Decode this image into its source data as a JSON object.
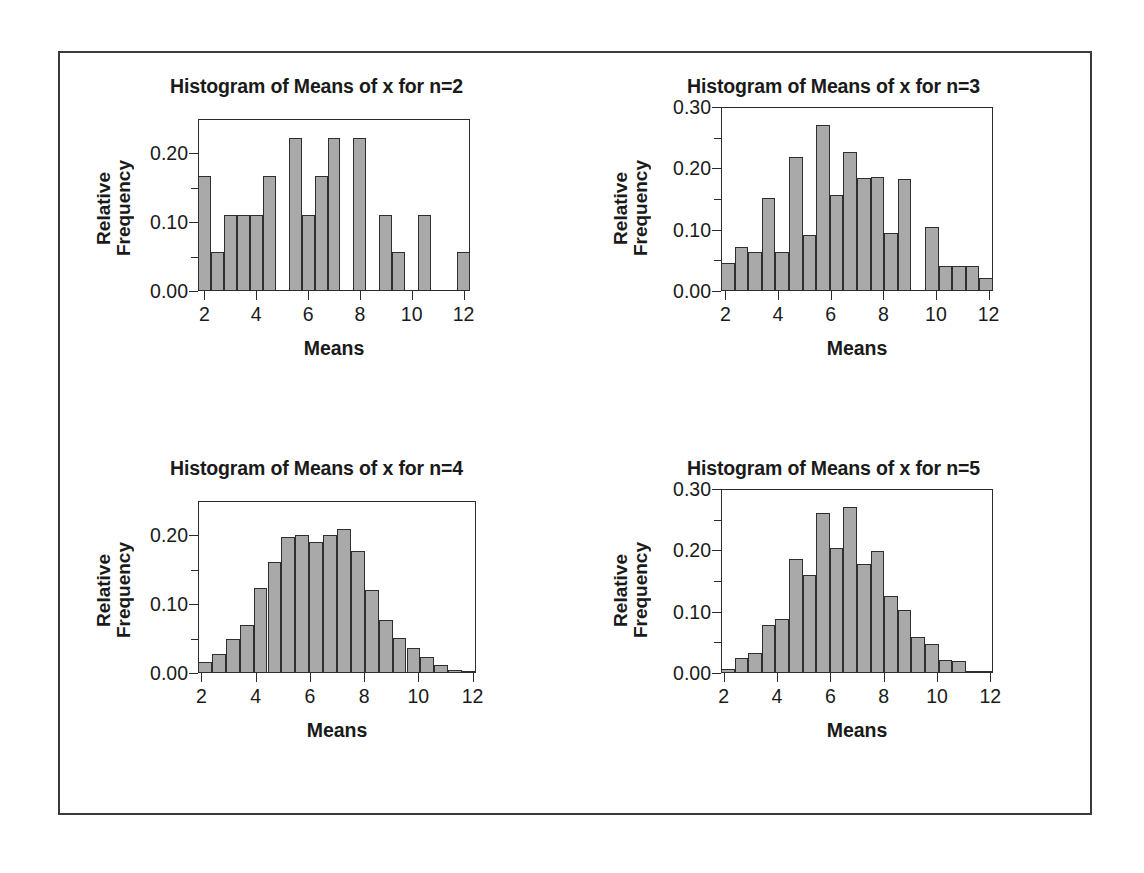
{
  "figure": {
    "border_color": "#3a3a3a",
    "background": "#ffffff",
    "bar_fill": "#a9a9a9",
    "bar_edge": "#2e2e2e"
  },
  "panels": [
    {
      "id": "n2",
      "title": "Histogram of Means of x for n=2",
      "xlabel": "Means",
      "ylabel_line1": "Relative",
      "ylabel_line2": "Frequency"
    },
    {
      "id": "n3",
      "title": "Histogram of Means of x for n=3",
      "xlabel": "Means",
      "ylabel_line1": "Relative",
      "ylabel_line2": "Frequency"
    },
    {
      "id": "n4",
      "title": "Histogram of Means of x for n=4",
      "xlabel": "Means",
      "ylabel_line1": "Relative",
      "ylabel_line2": "Frequency"
    },
    {
      "id": "n5",
      "title": "Histogram of Means of x for n=5",
      "xlabel": "Means",
      "ylabel_line1": "Relative",
      "ylabel_line2": "Frequency"
    }
  ],
  "chart_data": [
    {
      "type": "bar",
      "id": "n2",
      "title": "Histogram of Means of x for n=2",
      "xlabel": "Means",
      "ylabel": "Relative Frequency",
      "xlim": [
        1.75,
        12.25
      ],
      "ylim": [
        0.0,
        0.25
      ],
      "xticks": [
        2,
        4,
        6,
        8,
        10,
        12
      ],
      "xtick_labels": [
        "2",
        "4",
        "6",
        "8",
        "10",
        "12"
      ],
      "yticks": [
        0.0,
        0.1,
        0.2
      ],
      "ytick_labels": [
        "0.00",
        "0.10",
        "0.20"
      ],
      "yminor_ticks": [
        0.05,
        0.15
      ],
      "grid": false,
      "legend": "none",
      "bin_width": 0.5,
      "bin_lefts": [
        1.75,
        2.25,
        2.75,
        3.25,
        3.75,
        4.25,
        4.75,
        5.25,
        5.75,
        6.25,
        6.75,
        7.25,
        7.75,
        8.25,
        8.75,
        9.25,
        9.75,
        10.25,
        10.75,
        11.25,
        11.75
      ],
      "values": [
        0.167,
        0.056,
        0.111,
        0.111,
        0.111,
        0.167,
        0.0,
        0.222,
        0.111,
        0.167,
        0.222,
        0.0,
        0.222,
        0.0,
        0.111,
        0.056,
        0.0,
        0.111,
        0.0,
        0.0,
        0.056
      ]
    },
    {
      "type": "bar",
      "id": "n3",
      "title": "Histogram of Means of x for n=3",
      "xlabel": "Means",
      "ylabel": "Relative Frequency",
      "xlim": [
        1.833,
        12.167
      ],
      "ylim": [
        0.0,
        0.3
      ],
      "xticks": [
        2,
        4,
        6,
        8,
        10,
        12
      ],
      "xtick_labels": [
        "2",
        "4",
        "6",
        "8",
        "10",
        "12"
      ],
      "yticks": [
        0.0,
        0.1,
        0.2,
        0.3
      ],
      "ytick_labels": [
        "0.00",
        "0.10",
        "0.20",
        "0.30"
      ],
      "yminor_ticks": [
        0.05,
        0.15,
        0.25
      ],
      "grid": false,
      "legend": "none",
      "bin_width": 0.5167,
      "bin_lefts": [
        1.833,
        2.35,
        2.867,
        3.383,
        3.9,
        4.417,
        4.933,
        5.45,
        5.967,
        6.483,
        7.0,
        7.517,
        8.033,
        8.55,
        9.067,
        9.583,
        10.1,
        10.617,
        11.133,
        11.65
      ],
      "values": [
        0.046,
        0.072,
        0.063,
        0.151,
        0.063,
        0.218,
        0.092,
        0.27,
        0.157,
        0.226,
        0.184,
        0.186,
        0.095,
        0.182,
        0.0,
        0.104,
        0.04,
        0.04,
        0.041,
        0.021
      ]
    },
    {
      "type": "bar",
      "id": "n4",
      "title": "Histogram of Means of x for n=4",
      "xlabel": "Means",
      "ylabel": "Relative Frequency",
      "xlim": [
        1.875,
        12.125
      ],
      "ylim": [
        0.0,
        0.25
      ],
      "xticks": [
        2,
        4,
        6,
        8,
        10,
        12
      ],
      "xtick_labels": [
        "2",
        "4",
        "6",
        "8",
        "10",
        "12"
      ],
      "yticks": [
        0.0,
        0.1,
        0.2
      ],
      "ytick_labels": [
        "0.00",
        "0.10",
        "0.20"
      ],
      "yminor_ticks": [
        0.05,
        0.15
      ],
      "grid": false,
      "legend": "none",
      "bin_width": 0.5125,
      "bin_lefts": [
        1.875,
        2.3875,
        2.9,
        3.4125,
        3.925,
        4.4375,
        4.95,
        5.4625,
        5.975,
        6.4875,
        7.0,
        7.5125,
        8.025,
        8.5375,
        9.05,
        9.5625,
        10.075,
        10.5875,
        11.1,
        11.6125
      ],
      "values": [
        0.016,
        0.028,
        0.05,
        0.07,
        0.124,
        0.161,
        0.197,
        0.201,
        0.19,
        0.2,
        0.209,
        0.178,
        0.121,
        0.077,
        0.051,
        0.037,
        0.024,
        0.012,
        0.005,
        0.003
      ]
    },
    {
      "type": "bar",
      "id": "n5",
      "title": "Histogram of Means of x for n=5",
      "xlabel": "Means",
      "ylabel": "Relative Frequency",
      "xlim": [
        1.9,
        12.1
      ],
      "ylim": [
        0.0,
        0.3
      ],
      "xticks": [
        2,
        4,
        6,
        8,
        10,
        12
      ],
      "xtick_labels": [
        "2",
        "4",
        "6",
        "8",
        "10",
        "12"
      ],
      "yticks": [
        0.0,
        0.1,
        0.2,
        0.3
      ],
      "ytick_labels": [
        "0.00",
        "0.10",
        "0.20",
        "0.30"
      ],
      "yminor_ticks": [
        0.05,
        0.15,
        0.25
      ],
      "grid": false,
      "legend": "none",
      "bin_width": 0.51,
      "bin_lefts": [
        1.9,
        2.41,
        2.92,
        3.43,
        3.94,
        4.45,
        4.96,
        5.47,
        5.98,
        6.49,
        7.0,
        7.51,
        8.02,
        8.53,
        9.04,
        9.55,
        10.06,
        10.57,
        11.08,
        11.59
      ],
      "values": [
        0.006,
        0.025,
        0.033,
        0.078,
        0.088,
        0.186,
        0.159,
        0.261,
        0.204,
        0.27,
        0.178,
        0.199,
        0.126,
        0.102,
        0.058,
        0.048,
        0.021,
        0.02,
        0.004,
        0.003
      ]
    }
  ]
}
